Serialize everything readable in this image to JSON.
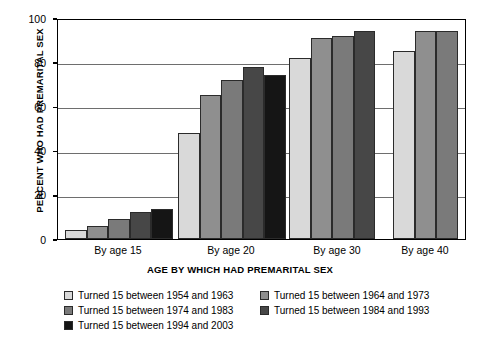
{
  "chart_data": {
    "type": "bar",
    "title": "",
    "xlabel": "AGE BY WHICH HAD PREMARITAL SEX",
    "ylabel": "PERCENT WHO HAD PREMARITAL SEX",
    "ylim": [
      0,
      100
    ],
    "ytick_labels": [
      "0",
      "20",
      "40",
      "60",
      "80",
      "100"
    ],
    "ytick_values": [
      0,
      20,
      40,
      60,
      80,
      100
    ],
    "grid": true,
    "legend_position": "bottom",
    "categories": [
      "By age 15",
      "By age 20",
      "By age 30",
      "By age 40"
    ],
    "series": [
      {
        "name": "Turned 15 between 1954 and 1963",
        "color": "#d9d9d9",
        "values": [
          4,
          48,
          82,
          85
        ]
      },
      {
        "name": "Turned 15 between 1964 and 1973",
        "color": "#8f8f8f",
        "values": [
          6,
          65,
          91,
          94
        ]
      },
      {
        "name": "Turned 15 between 1974 and 1983",
        "color": "#7a7a7a",
        "values": [
          9,
          72,
          92,
          94
        ]
      },
      {
        "name": "Turned 15 between 1984 and 1993",
        "color": "#474747",
        "values": [
          12,
          78,
          94,
          null
        ]
      },
      {
        "name": "Turned 15 between 1994 and 2003",
        "color": "#151515",
        "values": [
          13.5,
          74,
          null,
          null
        ]
      }
    ]
  },
  "legend": {
    "rows": [
      [
        {
          "label": "Turned 15 between 1954 and 1963",
          "color": "#d9d9d9"
        },
        {
          "label": "Turned 15 between 1964 and 1973",
          "color": "#8f8f8f"
        }
      ],
      [
        {
          "label": "Turned 15 between 1974 and 1983",
          "color": "#7a7a7a"
        },
        {
          "label": "Turned 15 between 1984 and 1993",
          "color": "#474747"
        }
      ],
      [
        {
          "label": "Turned 15 between 1994 and 2003",
          "color": "#151515"
        }
      ]
    ]
  }
}
